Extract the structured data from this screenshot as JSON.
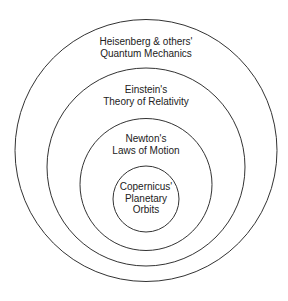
{
  "diagram": {
    "type": "nested-circles",
    "stroke_color": "#333333",
    "background": "#ffffff",
    "rings": [
      {
        "id": "outer",
        "line1": "Heisenberg & others'",
        "line2": "Quantum Mechanics",
        "line3": ""
      },
      {
        "id": "second",
        "line1": "Einstein's",
        "line2": "Theory of Relativity",
        "line3": ""
      },
      {
        "id": "third",
        "line1": "Newton's",
        "line2": "Laws of Motion",
        "line3": ""
      },
      {
        "id": "inner",
        "line1": "Copernicus'",
        "line2": "Planetary",
        "line3": "Orbits"
      }
    ]
  }
}
